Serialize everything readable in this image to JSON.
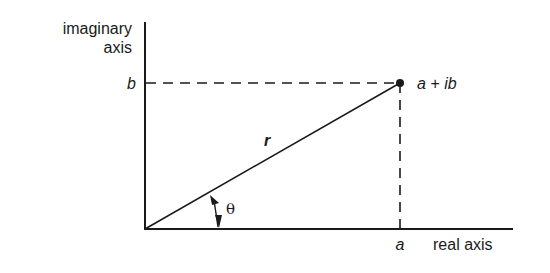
{
  "diagram": {
    "labels": {
      "imaginary_axis_line1": "imaginary",
      "imaginary_axis_line2": "axis",
      "real_axis": "real axis",
      "b": "b",
      "a": "a",
      "point": "a + ib",
      "r": "r",
      "theta": "θ"
    },
    "geometry": {
      "origin": [
        145,
        229
      ],
      "point": [
        400,
        83
      ],
      "y_axis_top": 22,
      "x_axis_right": 513
    },
    "colors": {
      "line": "#1a1a1a",
      "background": "#ffffff"
    }
  }
}
